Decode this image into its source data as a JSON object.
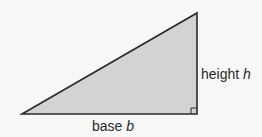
{
  "diagram": {
    "type": "right-triangle",
    "fill_color": "#d3d3d3",
    "stroke_color": "#2a2a2a",
    "vertices": {
      "bottom_left": [
        22,
        114
      ],
      "bottom_right": [
        197,
        114
      ],
      "top_right": [
        197,
        13
      ]
    },
    "right_angle_marker": true,
    "labels": {
      "height": {
        "text": "height",
        "var": "h"
      },
      "base": {
        "text": "base",
        "var": "b"
      }
    }
  }
}
